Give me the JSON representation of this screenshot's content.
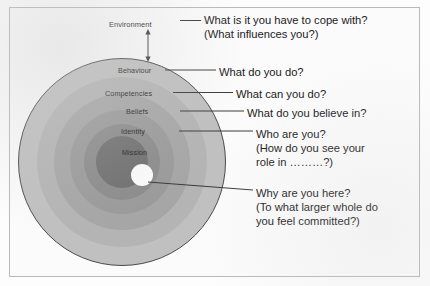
{
  "diagram": {
    "frame": {
      "border_color": "#b9b9b9",
      "background": "#fbfbfb"
    }
  },
  "rings": [
    {
      "key": "environment",
      "label": "Environment",
      "fill": "#c0c0c0",
      "outline": "#4a4a4a"
    },
    {
      "key": "behaviour",
      "label": "Behaviour",
      "fill": "#b4b4b4",
      "outline": "none"
    },
    {
      "key": "competencies",
      "label": "Competencies",
      "fill": "#a6a6a6",
      "outline": "none"
    },
    {
      "key": "beliefs",
      "label": "Beliefs",
      "fill": "#9a9a9a",
      "outline": "none"
    },
    {
      "key": "identity",
      "label": "Identity",
      "fill": "#8b8b8b",
      "outline": "none"
    },
    {
      "key": "mission",
      "label": "Mission",
      "fill": "#6f6f6f",
      "outline": "none"
    },
    {
      "key": "core",
      "label": "",
      "fill": "#fbfbfb",
      "outline": "none"
    }
  ],
  "questions": {
    "environment": "What is it you have to cope with?\n(What influences you?)",
    "behaviour": "What do you do?",
    "competencies": "What can you do?",
    "beliefs": "What do you believe in?",
    "identity": "Who are you?\n(How do you see your\nrole in ………?)",
    "mission": "Why are you here?\n(To what larger whole do\nyou feel committed?)"
  },
  "connectors": {
    "arrow_name": "environment-double-arrow",
    "line_color": "#3a3a3a"
  }
}
